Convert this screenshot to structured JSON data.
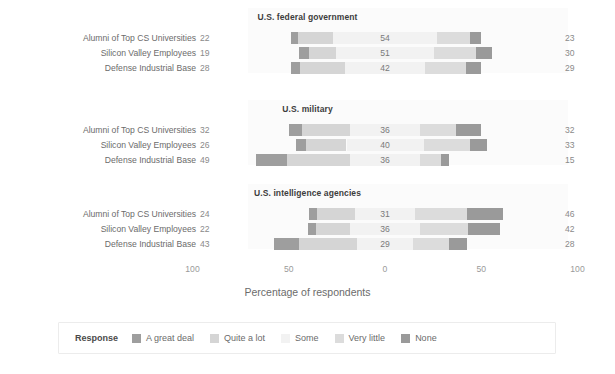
{
  "chart_data": {
    "type": "bar",
    "subtype": "diverging-stacked-likert",
    "title": "",
    "xlabel": "Percentage of respondents",
    "ylabel": "",
    "xlim": [
      -100,
      100
    ],
    "xticks": [
      100,
      50,
      0,
      50,
      100
    ],
    "xtick_labels": [
      "100",
      "50",
      "0",
      "50",
      "100"
    ],
    "grid": false,
    "legend_position": "bottom",
    "legend_title": "Response",
    "categories": [
      "A great deal",
      "Quite a lot",
      "Some",
      "Very little",
      "None"
    ],
    "colors": [
      "#9e9e9e",
      "#d5d5d5",
      "#f2f2f2",
      "#dcdcdc",
      "#9a9a9a"
    ],
    "negative_categories": [
      "A great deal",
      "Quite a lot"
    ],
    "neutral_category": "Some",
    "positive_categories": [
      "Very little",
      "None"
    ],
    "groups": [
      "Alumni of Top CS Universities",
      "Silicon Valley Employees",
      "Defense Industrial Base"
    ],
    "panels": [
      {
        "title": "U.S. federal government",
        "rows": [
          {
            "group": "Alumni of Top CS Universities",
            "left_total": 22,
            "middle": 54,
            "right_total": 23,
            "values": {
              "A great deal": 4,
              "Quite a lot": 18,
              "Some": 54,
              "Very little": 17,
              "None": 6
            }
          },
          {
            "group": "Silicon Valley Employees",
            "left_total": 19,
            "middle": 51,
            "right_total": 30,
            "values": {
              "A great deal": 5,
              "Quite a lot": 14,
              "Some": 51,
              "Very little": 22,
              "None": 8
            }
          },
          {
            "group": "Defense Industrial Base",
            "left_total": 28,
            "middle": 42,
            "right_total": 29,
            "values": {
              "A great deal": 5,
              "Quite a lot": 23,
              "Some": 42,
              "Very little": 21,
              "None": 8
            }
          }
        ]
      },
      {
        "title": "U.S. military",
        "rows": [
          {
            "group": "Alumni of Top CS Universities",
            "left_total": 32,
            "middle": 36,
            "right_total": 32,
            "values": {
              "A great deal": 7,
              "Quite a lot": 25,
              "Some": 36,
              "Very little": 19,
              "None": 13
            }
          },
          {
            "group": "Silicon Valley Employees",
            "left_total": 26,
            "middle": 40,
            "right_total": 33,
            "values": {
              "A great deal": 5,
              "Quite a lot": 21,
              "Some": 40,
              "Very little": 24,
              "None": 9
            }
          },
          {
            "group": "Defense Industrial Base",
            "left_total": 49,
            "middle": 36,
            "right_total": 15,
            "values": {
              "A great deal": 16,
              "Quite a lot": 33,
              "Some": 36,
              "Very little": 11,
              "None": 4
            }
          }
        ]
      },
      {
        "title": "U.S. intelligence agencies",
        "rows": [
          {
            "group": "Alumni of Top CS Universities",
            "left_total": 24,
            "middle": 31,
            "right_total": 46,
            "values": {
              "A great deal": 4,
              "Quite a lot": 20,
              "Some": 31,
              "Very little": 27,
              "None": 19
            }
          },
          {
            "group": "Silicon Valley Employees",
            "left_total": 22,
            "middle": 36,
            "right_total": 42,
            "values": {
              "A great deal": 4,
              "Quite a lot": 18,
              "Some": 36,
              "Very little": 25,
              "None": 17
            }
          },
          {
            "group": "Defense Industrial Base",
            "left_total": 43,
            "middle": 29,
            "right_total": 28,
            "values": {
              "A great deal": 13,
              "Quite a lot": 30,
              "Some": 29,
              "Very little": 19,
              "None": 9
            }
          }
        ]
      }
    ]
  },
  "legend": {
    "title": "Response",
    "items": [
      {
        "label": "A great deal",
        "color": "#9e9e9e"
      },
      {
        "label": "Quite a lot",
        "color": "#d5d5d5"
      },
      {
        "label": "Some",
        "color": "#f2f2f2"
      },
      {
        "label": "Very little",
        "color": "#dcdcdc"
      },
      {
        "label": "None",
        "color": "#9a9a9a"
      }
    ]
  },
  "axis": {
    "title": "Percentage of respondents",
    "ticks": [
      "100",
      "50",
      "0",
      "50",
      "100"
    ]
  }
}
